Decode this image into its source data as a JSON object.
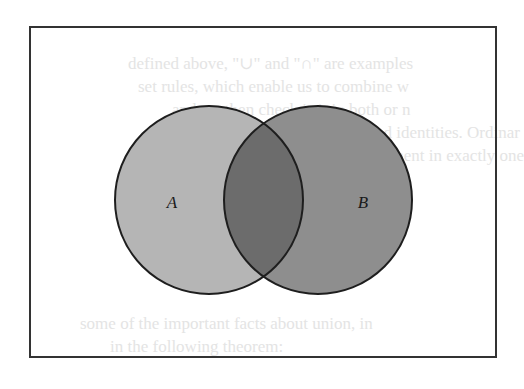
{
  "diagram": {
    "type": "venn",
    "sets": [
      {
        "id": "A",
        "label": "A",
        "fill": "#b5b5b5"
      },
      {
        "id": "B",
        "label": "B",
        "fill": "#8e8e8e"
      }
    ],
    "intersection": {
      "sets": [
        "A",
        "B"
      ],
      "fill": "#6c6c6c"
    },
    "outline_color": "#1e1e1e",
    "frame_color": "#333333",
    "universe_background": "#ffffff"
  },
  "bleed_through_text": [
    "defined above, \"∪\" and \"∩\" are examples",
    "set rules, which enable us to combine w",
    "and we then check is it in both or n",
    "some rules and identities. Ordinar",
    "at least one element in exactly one",
    "",
    "",
    "some of the important facts about union, in",
    "in the following theorem:"
  ]
}
